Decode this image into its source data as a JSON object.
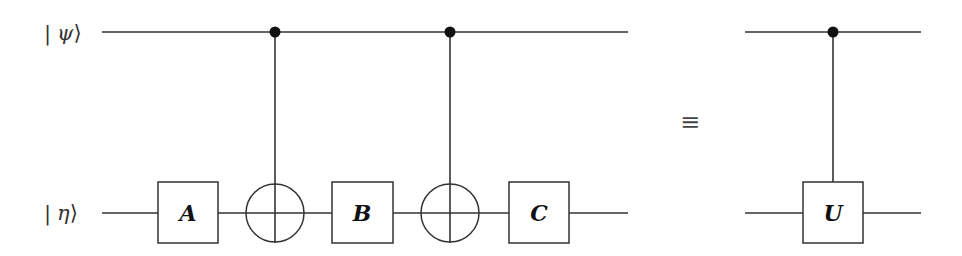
{
  "diagram": {
    "type": "quantum-circuit",
    "qubits": [
      {
        "label_bar": "|",
        "label_symbol": "ψ",
        "label_close": "⟩",
        "name": "psi"
      },
      {
        "label_bar": "|",
        "label_symbol": "η",
        "label_close": "⟩",
        "name": "eta"
      }
    ],
    "left_circuit": {
      "gates": [
        {
          "type": "single",
          "label": "A",
          "target": "eta"
        },
        {
          "type": "cnot",
          "control": "psi",
          "target": "eta"
        },
        {
          "type": "single",
          "label": "B",
          "target": "eta"
        },
        {
          "type": "cnot",
          "control": "psi",
          "target": "eta"
        },
        {
          "type": "single",
          "label": "C",
          "target": "eta"
        }
      ]
    },
    "equivalence_symbol": "≡",
    "right_circuit": {
      "gates": [
        {
          "type": "controlled",
          "label": "U",
          "control": "psi",
          "target": "eta"
        }
      ]
    },
    "colors": {
      "line": "#333333",
      "dot": "#111111",
      "background": "#ffffff"
    }
  }
}
